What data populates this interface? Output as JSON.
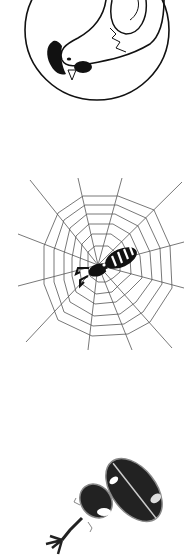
{
  "illustrations": [
    {
      "id": "bird",
      "subject": "bird diving inside circle",
      "icon": "bird-icon"
    },
    {
      "id": "spider",
      "subject": "spider on web",
      "icon": "spider-web-icon"
    },
    {
      "id": "beetle",
      "subject": "horned beetle",
      "icon": "beetle-icon"
    }
  ],
  "colors": {
    "ink": "#111111",
    "web": "#555555",
    "background": "#ffffff"
  }
}
